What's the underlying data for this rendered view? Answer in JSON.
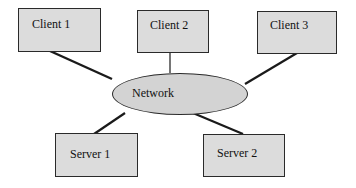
{
  "diagram": {
    "clients": [
      {
        "label": "Client 1"
      },
      {
        "label": "Client 2"
      },
      {
        "label": "Client 3"
      }
    ],
    "network": {
      "label": "Network"
    },
    "servers": [
      {
        "label": "Server 1"
      },
      {
        "label": "Server 2"
      }
    ]
  },
  "colors": {
    "box_fill": "#dcdcdc",
    "ellipse_fill": "#d3d3d3",
    "stroke": "#2a2a2a"
  }
}
